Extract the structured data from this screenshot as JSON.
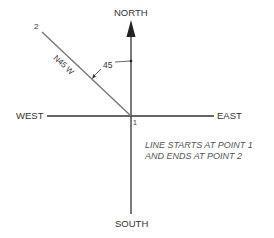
{
  "diagram": {
    "type": "compass-bearing",
    "directions": {
      "north": "NORTH",
      "south": "SOUTH",
      "east": "EAST",
      "west": "WEST"
    },
    "bearing_label": "N45 W",
    "angle_label": "45",
    "point_start_label": "1",
    "point_end_label": "2",
    "note_line1": "LINE STARTS AT POINT 1",
    "note_line2": "AND ENDS AT POINT 2",
    "colors": {
      "axis": "#333333",
      "bearing_line": "#777777",
      "text": "#333333",
      "note": "#555555"
    }
  }
}
